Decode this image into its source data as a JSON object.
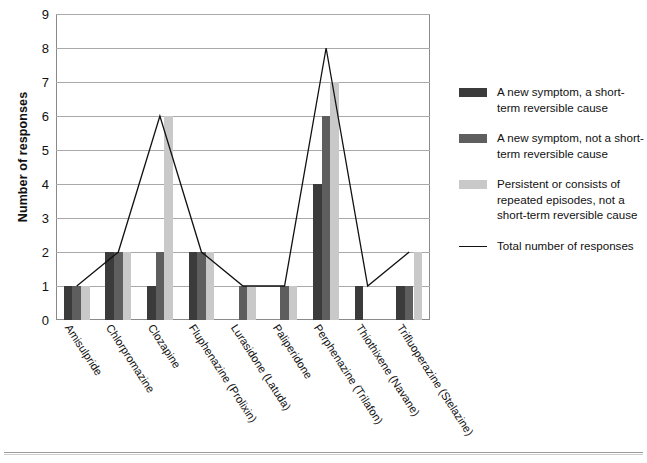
{
  "chart_data": {
    "type": "bar",
    "title": "",
    "xlabel": "",
    "ylabel": "Number of responses",
    "ylim": [
      0,
      9
    ],
    "yticks": [
      0,
      1,
      2,
      3,
      4,
      5,
      6,
      7,
      8,
      9
    ],
    "grid": true,
    "legend_position": "right",
    "categories": [
      "Amisulpride",
      "Chlorpromazine",
      "Clozapine",
      "Fluphenazine (Prolixin)",
      "Lurasidone (Latuda)",
      "Paliperidone",
      "Perphenazine (Trilafon)",
      "Thiothixene (Navane)",
      "Trifluoperazine (Stelazine)"
    ],
    "series": [
      {
        "name": "A new symptom, a short-term reversible cause",
        "color": "#3b3b3b",
        "values": [
          1,
          2,
          1,
          2,
          0,
          0,
          4,
          1,
          1
        ]
      },
      {
        "name": "A new symptom, not a short-term reversible cause",
        "color": "#5e5e5e",
        "values": [
          1,
          2,
          2,
          2,
          1,
          1,
          6,
          0,
          1
        ]
      },
      {
        "name": "Persistent or consists of repeated episodes, not a short-term reversible cause",
        "color": "#c9c9c9",
        "values": [
          1,
          2,
          6,
          2,
          1,
          1,
          7,
          0,
          2
        ]
      }
    ],
    "line_series": {
      "name": "Total number of responses",
      "color": "#111111",
      "values": [
        1,
        2,
        6,
        2,
        1,
        1,
        8,
        1,
        2
      ]
    }
  },
  "legend": {
    "items": [
      {
        "label": "A new symptom, a short-term reversible cause",
        "swatch": "#3b3b3b",
        "kind": "box"
      },
      {
        "label": "A new symptom, not a short-term reversible cause",
        "swatch": "#5e5e5e",
        "kind": "box"
      },
      {
        "label": "Persistent or consists of repeated episodes, not a short-term reversible cause",
        "swatch": "#c9c9c9",
        "kind": "box"
      },
      {
        "label": "Total number of responses",
        "swatch": "#111111",
        "kind": "line"
      }
    ]
  }
}
